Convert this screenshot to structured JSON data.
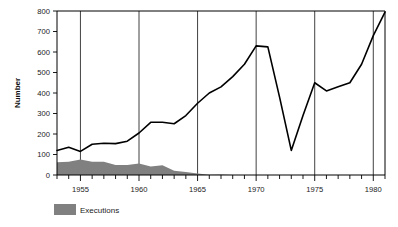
{
  "chart_data": {
    "type": "line",
    "title": "",
    "xlabel": "",
    "ylabel": "Number",
    "xlim": [
      1953,
      1981
    ],
    "ylim": [
      0,
      800
    ],
    "grid": "vertical-at-labeled-years",
    "legend_position": "below-left",
    "y_ticks": [
      0,
      100,
      200,
      300,
      400,
      500,
      600,
      700,
      800
    ],
    "y_tick_labels": [
      "0",
      "100",
      "200",
      "300",
      "400",
      "500",
      "600",
      "700",
      "800"
    ],
    "x_ticks": [
      1953,
      1954,
      1955,
      1956,
      1957,
      1958,
      1959,
      1960,
      1961,
      1962,
      1963,
      1964,
      1965,
      1966,
      1967,
      1968,
      1969,
      1970,
      1971,
      1972,
      1973,
      1974,
      1975,
      1976,
      1977,
      1978,
      1979,
      1980,
      1981
    ],
    "x_tick_labels_shown": [
      "1955",
      "1960",
      "1965",
      "1970",
      "1975",
      "1980"
    ],
    "x_labeled_years": [
      1955,
      1960,
      1965,
      1970,
      1975,
      1980
    ],
    "series": [
      {
        "name": "line-series",
        "style": "line",
        "color": "#000000",
        "x": [
          1953,
          1954,
          1955,
          1956,
          1957,
          1958,
          1959,
          1960,
          1961,
          1962,
          1963,
          1964,
          1965,
          1966,
          1967,
          1968,
          1969,
          1970,
          1971,
          1972,
          1973,
          1974,
          1975,
          1976,
          1977,
          1978,
          1979,
          1980,
          1981
        ],
        "values": [
          120,
          135,
          115,
          150,
          155,
          153,
          165,
          205,
          257,
          257,
          250,
          290,
          350,
          400,
          430,
          480,
          540,
          630,
          625,
          380,
          120,
          290,
          450,
          410,
          430,
          450,
          540,
          680,
          795
        ]
      },
      {
        "name": "Executions",
        "style": "area",
        "color": "#808080",
        "x": [
          1953,
          1954,
          1955,
          1956,
          1957,
          1958,
          1959,
          1960,
          1961,
          1962,
          1963,
          1964,
          1965,
          1966,
          1967,
          1968,
          1969,
          1970,
          1971,
          1972,
          1973,
          1974,
          1975,
          1976,
          1977,
          1978,
          1979,
          1980,
          1981
        ],
        "values": [
          62,
          65,
          76,
          65,
          65,
          49,
          49,
          56,
          42,
          47,
          21,
          15,
          7,
          1,
          2,
          0,
          0,
          0,
          0,
          0,
          0,
          0,
          0,
          0,
          0,
          0,
          0,
          0,
          0
        ]
      }
    ],
    "legend": [
      {
        "label": "Executions",
        "color": "#808080",
        "swatch": "filled-rect"
      }
    ]
  },
  "axes": {
    "y_axis_title": "Number"
  }
}
